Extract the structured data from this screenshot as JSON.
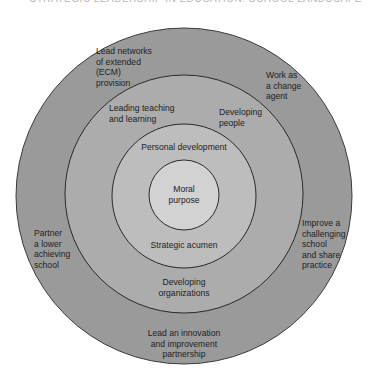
{
  "header": {
    "text": "STRATEGIC LEADERSHIP IN EDUCATION: SCHOOL LANDSCAPE"
  },
  "colors": {
    "outer_ring": "#9a9a9a",
    "second_ring": "#acacac",
    "third_ring": "#bdbdbd",
    "core": "#d2d2d2",
    "stroke": "#2a2a2a"
  },
  "rings": {
    "core": {
      "label_line1": "Moral",
      "label_line2": "purpose"
    },
    "third": {
      "top": "Personal development",
      "bottom": "Strategic acumen"
    },
    "second": {
      "top_left_line1": "Leading teaching",
      "top_left_line2": "and learning",
      "top_right_line1": "Developing",
      "top_right_line2": "people",
      "bottom_line1": "Developing",
      "bottom_line2": "organizations"
    },
    "outer": {
      "top_left_line1": "Lead networks",
      "top_left_line2": "of extended",
      "top_left_line3": "(ECM)",
      "top_left_line4": "provision",
      "top_right_line1": "Work as",
      "top_right_line2": "a change",
      "top_right_line3": "agent",
      "left_line1": "Partner",
      "left_line2": "a lower",
      "left_line3": "achieving",
      "left_line4": "school",
      "right_line1": "Improve a",
      "right_line2": "challenging",
      "right_line3": "school",
      "right_line4": "and share",
      "right_line5": "practice",
      "bottom_line1": "Lead an innovation",
      "bottom_line2": "and improvement",
      "bottom_line3": "partnership"
    }
  }
}
